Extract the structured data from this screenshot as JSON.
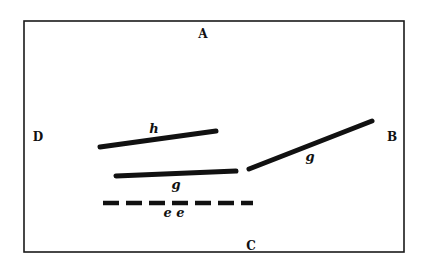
{
  "figure": {
    "colors": {
      "ink": "#111111",
      "paper": "#ffffff"
    },
    "frame_labels": {
      "top": "A",
      "right": "B",
      "bottom": "C",
      "left": "D"
    },
    "segments": [
      {
        "id": "h",
        "label": "h",
        "style": "solid"
      },
      {
        "id": "g-horizontal",
        "label": "g",
        "style": "solid"
      },
      {
        "id": "g-slanted",
        "label": "g",
        "style": "solid"
      },
      {
        "id": "e",
        "label": "e e",
        "style": "dashed"
      }
    ]
  }
}
